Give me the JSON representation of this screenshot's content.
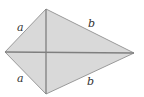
{
  "figure": {
    "type": "kite",
    "colors": {
      "fill": "#d9d9d9",
      "edge": "#9a9a9a",
      "diagonal": "#7f7f7f",
      "label": "#333333"
    },
    "vertices": {
      "left": [
        5,
        52
      ],
      "top": [
        46,
        9
      ],
      "right": [
        134,
        53
      ],
      "bottom": [
        46,
        94
      ]
    },
    "labels": {
      "top_left": "a",
      "top_right": "b",
      "bottom_left": "a",
      "bottom_right": "b"
    }
  }
}
